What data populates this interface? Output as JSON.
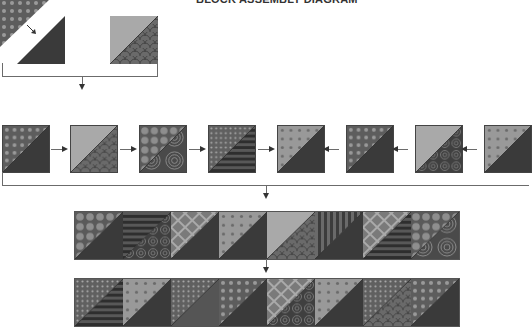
{
  "title": "BLOCK ASSEMBLY DIAGRAM",
  "colors": {
    "line": "#6b6b6b",
    "arrow": "#333333",
    "dark": "#3a3a3a",
    "medium": "#6e6e6e",
    "light": "#a9a9a9"
  },
  "patterns": {
    "dots": "grey with light polka dots",
    "scales": "fish-scale print",
    "circles": "concentric circles",
    "stripes": "horizontal stripes",
    "swirls": "swirl print",
    "lattice": "diamond lattice",
    "solid_dark": "dark solid",
    "solid_light": "light solid",
    "speckle": "small dense dots",
    "bubbles": "large bubble dots"
  },
  "step1": {
    "description": "Half-square triangle construction",
    "blocks": [
      {
        "top": "dots",
        "bottom": "solid_dark",
        "exploded": true
      },
      {
        "top": "solid_light",
        "bottom": "scales",
        "exploded": false
      }
    ]
  },
  "row1": {
    "arrows_left_half": "right",
    "arrows_right_half": "left",
    "blocks": [
      {
        "top": "dots",
        "bottom": "solid_dark"
      },
      {
        "top": "solid_light",
        "bottom": "scales"
      },
      {
        "top": "bubbles",
        "bottom": "circles"
      },
      {
        "top": "speckle",
        "bottom": "stripes"
      },
      {
        "top": "dots_light",
        "bottom": "solid_dark"
      },
      {
        "top": "dots",
        "bottom": "solid_dark"
      },
      {
        "top": "solid_light",
        "bottom": "swirls"
      },
      {
        "top": "dots_light",
        "bottom": "solid_dark"
      }
    ]
  },
  "row2": {
    "blocks": [
      {
        "top": "bubbles",
        "bottom": "solid_dark"
      },
      {
        "top": "stripes",
        "bottom": "swirls"
      },
      {
        "top": "lattice",
        "bottom": "solid_dark"
      },
      {
        "top": "dots_light",
        "bottom": "solid_dark"
      },
      {
        "top": "solid_light",
        "bottom": "scales"
      },
      {
        "top": "stripes_v",
        "bottom": "solid_dark"
      },
      {
        "top": "lattice",
        "bottom": "stripes"
      },
      {
        "top": "bubbles",
        "bottom": "circles"
      }
    ]
  },
  "row3": {
    "blocks": [
      {
        "top": "speckle",
        "bottom": "stripes"
      },
      {
        "top": "dots_light",
        "bottom": "solid_dark"
      },
      {
        "top": "speckle",
        "bottom": "solid_medium"
      },
      {
        "top": "dots",
        "bottom": "solid_dark"
      },
      {
        "top": "lattice",
        "bottom": "swirls"
      },
      {
        "top": "dots_light",
        "bottom": "solid_dark"
      },
      {
        "top": "speckle",
        "bottom": "scales"
      },
      {
        "top": "dots",
        "bottom": "solid_dark"
      }
    ]
  }
}
